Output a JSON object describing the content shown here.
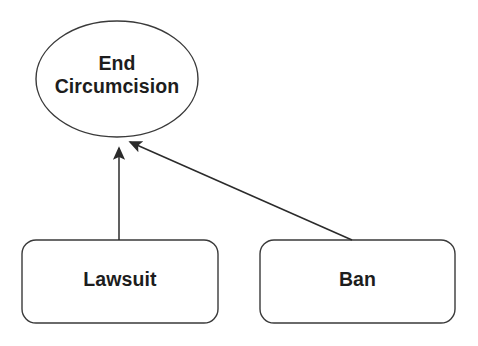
{
  "diagram": {
    "type": "goal-tree",
    "background_color": "#ffffff",
    "stroke_color": "#3a3a3a",
    "text_color": "#1d1d1d",
    "nodes": [
      {
        "id": "goal",
        "shape": "ellipse",
        "label": "End\nCircumcision",
        "label_lines": [
          "End",
          "Circumcision"
        ],
        "cx": 117,
        "cy": 79,
        "rx": 81,
        "ry": 58
      },
      {
        "id": "lawsuit",
        "shape": "rounded-rectangle",
        "label": "Lawsuit",
        "x": 22,
        "y": 240,
        "width": 196,
        "height": 83,
        "corner_radius": 14
      },
      {
        "id": "ban",
        "shape": "rounded-rectangle",
        "label": "Ban",
        "x": 260,
        "y": 240,
        "width": 195,
        "height": 83,
        "corner_radius": 14
      }
    ],
    "edges": [
      {
        "id": "lawsuit-to-goal",
        "from": "lawsuit",
        "to": "goal",
        "arrowhead": "filled-triangle",
        "x1": 119,
        "y1": 240,
        "x2": 119,
        "y2": 140
      },
      {
        "id": "ban-to-goal",
        "from": "ban",
        "to": "goal",
        "arrowhead": "filled-triangle",
        "x1": 352,
        "y1": 240,
        "x2": 123,
        "y2": 139
      }
    ]
  }
}
